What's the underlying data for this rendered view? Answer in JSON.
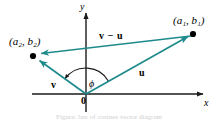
{
  "figure": {
    "kind": "vector-diagram",
    "background_color": "#ffffff",
    "axis_color": "#1a1a1a",
    "vector_color": "#1f8a8c",
    "point_color": "#000000",
    "caption": "Figure: law of cosines vector diagram"
  },
  "axes": {
    "x_label": "x",
    "y_label": "y",
    "origin_label": "0",
    "origin_px": {
      "x": 86,
      "y": 94
    },
    "x_axis_start_px": {
      "x": 32,
      "y": 94
    },
    "x_axis_end_px": {
      "x": 209,
      "y": 94
    },
    "y_axis_start_px": {
      "x": 86,
      "y": 112
    },
    "y_axis_end_px": {
      "x": 86,
      "y": 8
    }
  },
  "points": [
    {
      "id": "p1",
      "label": "(a₁, b₁)",
      "px": {
        "x": 193,
        "y": 34
      }
    },
    {
      "id": "p2",
      "label": "(a₂, b₂)",
      "px": {
        "x": 33,
        "y": 56
      }
    }
  ],
  "vectors": [
    {
      "id": "u",
      "label": "u",
      "from_px": {
        "x": 86,
        "y": 94
      },
      "to_px": {
        "x": 193,
        "y": 34
      }
    },
    {
      "id": "v",
      "label": "v",
      "from_px": {
        "x": 86,
        "y": 94
      },
      "to_px": {
        "x": 33,
        "y": 56
      }
    },
    {
      "id": "v-minus-u",
      "label": "v − u",
      "from_px": {
        "x": 191,
        "y": 36
      },
      "to_px": {
        "x": 37,
        "y": 54
      }
    }
  ],
  "angle": {
    "label": "ϕ",
    "vertex_px": {
      "x": 86,
      "y": 94
    },
    "radius_px": 26,
    "start_deg": 29,
    "end_deg": 144
  }
}
